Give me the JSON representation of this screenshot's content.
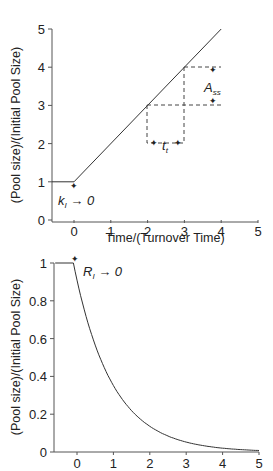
{
  "chart_data": [
    {
      "type": "line",
      "title": "",
      "xlabel": "Time/(Turnover Time)",
      "ylabel": "(Pool size)/(Initial Pool Size)",
      "xlim": [
        -0.6,
        5
      ],
      "ylim": [
        0,
        5
      ],
      "x_ticks": [
        "0",
        "1",
        "2",
        "3",
        "4",
        "5"
      ],
      "y_ticks": [
        "0",
        "1",
        "2",
        "3",
        "4",
        "5"
      ],
      "grid": false,
      "series": [
        {
          "name": "pool size (input step)",
          "x": [
            -0.6,
            0,
            4
          ],
          "values": [
            1,
            1,
            5
          ]
        }
      ],
      "annotations": {
        "start": {
          "text_main": "k",
          "text_sub": "I",
          "text_rest": " → 0",
          "x": 0,
          "y": 1
        },
        "tau": {
          "text_main": "t",
          "text_sub": "t",
          "x_from": 2,
          "x_to": 3,
          "y": 2
        },
        "ass": {
          "text_main": "A",
          "text_sub": "ss",
          "x": 3.8,
          "y_from": 3,
          "y_to": 4
        }
      }
    },
    {
      "type": "line",
      "title": "",
      "xlabel": "",
      "ylabel": "(Pool size)/(Initial Pool Size)",
      "xlim": [
        -0.6,
        5
      ],
      "ylim": [
        0,
        1
      ],
      "x_ticks": [
        "0",
        "1",
        "2",
        "3",
        "4",
        "5"
      ],
      "y_ticks": [
        "0",
        "0.2",
        "0.4",
        "0.6",
        "0.8",
        "1"
      ],
      "grid": false,
      "series": [
        {
          "name": "pool size (exponential decay)",
          "x": [
            -0.6,
            -0.1,
            0.5,
            1,
            1.5,
            2,
            2.5,
            3,
            3.5,
            4,
            4.5,
            5
          ],
          "values": [
            1,
            1,
            0.58,
            0.4,
            0.27,
            0.17,
            0.11,
            0.07,
            0.04,
            0.02,
            0.005,
            0.0
          ]
        }
      ],
      "annotations": {
        "start": {
          "text_main": "R",
          "text_sub": "I",
          "text_rest": " → 0",
          "x": 0,
          "y": 1
        }
      }
    }
  ]
}
